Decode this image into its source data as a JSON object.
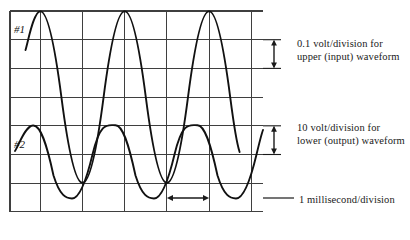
{
  "figure": {
    "type": "oscilloscope-display"
  },
  "graticule": {
    "left": 10,
    "top": 11,
    "right": 263,
    "bottom": 212,
    "h_line_count": 8,
    "v_line_count": 7,
    "division_px_x": 42.2,
    "division_px_y": 28.7,
    "line_color": "#3d3d3d",
    "border_color": "#2a2a2a",
    "background": "#ffffff"
  },
  "traces": [
    {
      "id": "trace-1",
      "label": "#1",
      "role": "input",
      "color": "#111111",
      "baseline_div_from_top": 3.0,
      "amplitude_div": 2.0,
      "period_div": 2.0,
      "phase_deg": 0,
      "start_div": -0.35,
      "end_div": 5.55
    },
    {
      "id": "trace-2",
      "label": "#2",
      "role": "output",
      "color": "#111111",
      "baseline_div_from_top": 5.5,
      "amplitude_div": 1.5,
      "period_div": 2.0,
      "phase_deg": 180,
      "start_div": -0.35,
      "end_div": 5.55
    }
  ],
  "annotations": {
    "upper_gain": {
      "line1": "0.1 volt/division for",
      "line2": "upper (input) waveform",
      "marker": "vertical-double-arrow",
      "span_divisions": 1
    },
    "lower_gain": {
      "line1": "10 volt/division for",
      "line2": "lower (output) waveform",
      "marker": "vertical-double-arrow",
      "span_divisions": 1
    },
    "timebase": {
      "line1": "1 millisecond/division",
      "marker": "horizontal-double-arrow",
      "span_divisions": 1
    }
  }
}
